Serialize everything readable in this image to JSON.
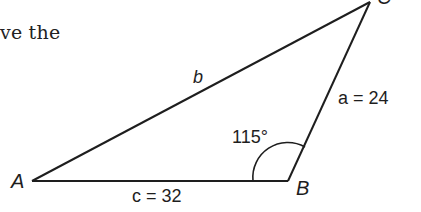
{
  "text_fragment": "ve the",
  "diagram": {
    "type": "triangle",
    "vertices": [
      {
        "name": "A",
        "label": "A",
        "x": 32,
        "y": 181
      },
      {
        "name": "B",
        "label": "B",
        "x": 288,
        "y": 181
      },
      {
        "name": "C",
        "label": "C",
        "x": 370,
        "y": 2
      }
    ],
    "sides": [
      {
        "name": "a",
        "label": "a",
        "value": "24",
        "display": "a = 24"
      },
      {
        "name": "b",
        "label": "b",
        "display": "b"
      },
      {
        "name": "c",
        "label": "c",
        "value": "32",
        "display": "c = 32"
      }
    ],
    "angle": {
      "vertex": "B",
      "label": "115°",
      "value": 115
    },
    "stroke_color": "#1e1e1e"
  }
}
